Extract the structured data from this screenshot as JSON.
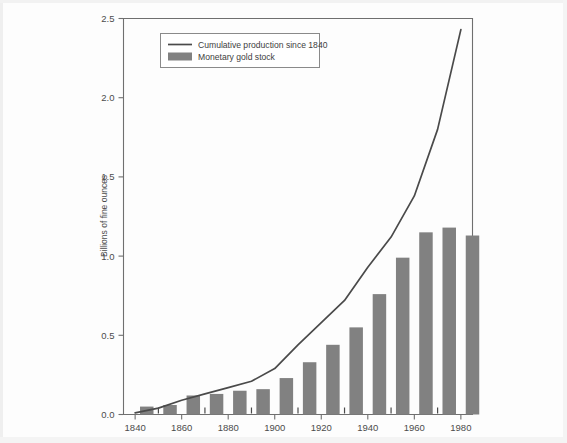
{
  "chart_data": {
    "type": "bar",
    "title": "",
    "subtitle": "",
    "xlabel": "",
    "ylabel": "Billions of fine ounces",
    "xlim": [
      1835,
      1985
    ],
    "ylim": [
      0.0,
      2.5
    ],
    "grid": false,
    "legend_position": "top-left",
    "y_ticks": [
      "0.0",
      "0.5",
      "1.0",
      "1.5",
      "2.0",
      "2.5"
    ],
    "y_tick_values": [
      0.0,
      0.5,
      1.0,
      1.5,
      2.0,
      2.5
    ],
    "x_ticks": [
      "1840",
      "1860",
      "1880",
      "1900",
      "1920",
      "1940",
      "1960",
      "1980"
    ],
    "x_tick_values": [
      1840,
      1860,
      1880,
      1900,
      1920,
      1940,
      1960,
      1980
    ],
    "x_minor_ticks": [
      1850,
      1870,
      1890,
      1910,
      1930,
      1950,
      1970
    ],
    "categories": [
      1840,
      1850,
      1860,
      1870,
      1880,
      1890,
      1900,
      1910,
      1920,
      1930,
      1940,
      1950,
      1960,
      1970,
      1980
    ],
    "series": [
      {
        "name": "Monetary gold stock",
        "type": "bar",
        "color": "#818181",
        "values": [
          0.05,
          0.06,
          0.12,
          0.13,
          0.15,
          0.16,
          0.23,
          0.33,
          0.44,
          0.55,
          0.76,
          0.99,
          1.15,
          1.18,
          1.13
        ]
      },
      {
        "name": "Cumulative production since 1840",
        "type": "line",
        "color": "#4a4a4a",
        "x": [
          1840,
          1850,
          1860,
          1870,
          1880,
          1890,
          1900,
          1910,
          1920,
          1930,
          1940,
          1950,
          1960,
          1970,
          1980
        ],
        "values": [
          0.01,
          0.04,
          0.09,
          0.13,
          0.17,
          0.21,
          0.29,
          0.44,
          0.58,
          0.72,
          0.93,
          1.12,
          1.38,
          1.8,
          2.43
        ]
      }
    ],
    "legend_entries": [
      {
        "label": "Cumulative production since 1840",
        "marker": "line",
        "color": "#4a4a4a"
      },
      {
        "label": "Monetary gold stock",
        "marker": "swatch",
        "color": "#818181"
      }
    ],
    "colors": {
      "bar": "#818181",
      "line": "#4a4a4a",
      "axis": "#6f6f6f",
      "text": "#4c4c4c",
      "background": "#fdfdfd"
    }
  }
}
